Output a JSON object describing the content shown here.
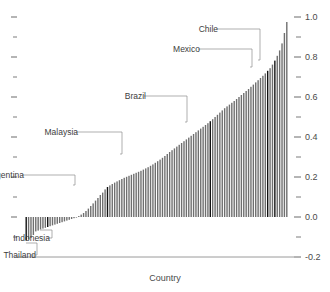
{
  "chart_data": {
    "type": "bar",
    "title": "",
    "xlabel": "Country",
    "ylabel": "",
    "ylim": [
      -0.2,
      1.0
    ],
    "grid": false,
    "legend": null,
    "right_axis_ticks": [
      "1.0",
      "0.8",
      "0.6",
      "0.4",
      "0.2",
      "0.0",
      "-0.2"
    ],
    "right_axis_tick_values": [
      1.0,
      0.8,
      0.6,
      0.4,
      0.2,
      0.0,
      -0.2
    ],
    "minor_tick_values": [
      0.9,
      0.7,
      0.5,
      0.3,
      0.1,
      -0.1
    ],
    "left_axis_tick_values": [
      1.0,
      0.9,
      0.8,
      0.7,
      0.6,
      0.5,
      0.4,
      0.3,
      0.2,
      0.1,
      0.0,
      -0.1
    ],
    "left_axis_labels": [],
    "categories": [
      "c1",
      "c2",
      "c3",
      "c4",
      "c5",
      "c6",
      "c7",
      "c8",
      "c9",
      "c10",
      "c11",
      "c12",
      "c13",
      "c14",
      "c15",
      "c16",
      "c17",
      "c18",
      "c19",
      "c20",
      "c21",
      "c22",
      "c23",
      "c24",
      "c25",
      "c26",
      "c27",
      "c28",
      "c29",
      "c30",
      "c31",
      "c32",
      "c33",
      "c34",
      "c35",
      "c36",
      "c37",
      "c38",
      "c39",
      "c40",
      "c41",
      "c42",
      "c43",
      "c44",
      "c45",
      "c46",
      "c47",
      "c48",
      "c49",
      "c50",
      "c51",
      "c52",
      "c53",
      "c54",
      "c55",
      "c56",
      "c57",
      "c58",
      "c59",
      "c60",
      "c61",
      "c62",
      "c63",
      "c64",
      "c65",
      "c66",
      "c67",
      "c68",
      "c69",
      "c70",
      "c71",
      "c72",
      "c73",
      "c74",
      "c75",
      "c76",
      "c77",
      "c78",
      "c79",
      "c80",
      "c81",
      "c82",
      "c83",
      "c84",
      "c85",
      "c86",
      "c87",
      "c88",
      "c89",
      "c90",
      "c91",
      "c92",
      "c93",
      "c94",
      "c95",
      "c96",
      "c97",
      "c98",
      "c99",
      "c100",
      "c101",
      "c102",
      "c103",
      "c104",
      "c105",
      "c106",
      "c107",
      "c108",
      "c109",
      "c110"
    ],
    "values": [
      -0.118,
      -0.112,
      -0.104,
      -0.09,
      -0.072,
      -0.068,
      -0.062,
      -0.058,
      -0.054,
      -0.05,
      -0.046,
      -0.042,
      -0.038,
      -0.034,
      -0.03,
      -0.026,
      -0.022,
      -0.018,
      -0.014,
      -0.01,
      -0.006,
      -0.003,
      0.005,
      0.012,
      0.02,
      0.03,
      0.042,
      0.055,
      0.068,
      0.082,
      0.095,
      0.11,
      0.122,
      0.138,
      0.15,
      0.158,
      0.165,
      0.172,
      0.178,
      0.184,
      0.19,
      0.196,
      0.201,
      0.206,
      0.211,
      0.216,
      0.221,
      0.226,
      0.231,
      0.237,
      0.243,
      0.249,
      0.256,
      0.263,
      0.271,
      0.279,
      0.287,
      0.296,
      0.305,
      0.315,
      0.325,
      0.334,
      0.343,
      0.352,
      0.361,
      0.37,
      0.379,
      0.388,
      0.397,
      0.406,
      0.415,
      0.424,
      0.433,
      0.442,
      0.451,
      0.46,
      0.469,
      0.479,
      0.489,
      0.5,
      0.511,
      0.522,
      0.533,
      0.544,
      0.553,
      0.562,
      0.571,
      0.58,
      0.59,
      0.6,
      0.61,
      0.62,
      0.63,
      0.64,
      0.651,
      0.662,
      0.673,
      0.684,
      0.695,
      0.706,
      0.718,
      0.731,
      0.744,
      0.762,
      0.782,
      0.806,
      0.833,
      0.868,
      0.92,
      0.975
    ],
    "highlighted_indices": [
      0,
      9,
      34,
      77,
      101,
      104
    ],
    "annotations": [
      {
        "name": "Thailand",
        "value": -0.118,
        "bar_index": 0,
        "label_x": 36,
        "label_y": 258,
        "leader": "M 30 255 L 37 255 L 37 243 L 26 243"
      },
      {
        "name": "Indonesia",
        "value": -0.05,
        "bar_index": 9,
        "label_x": 50,
        "label_y": 241,
        "leader": "M 47 238 L 52 238 L 52 230 L 40 230"
      },
      {
        "name": "Argentina",
        "value": 0.15,
        "bar_index": 34,
        "label_x": 24,
        "label_y": 178,
        "leader": "M 22 175 L 75 175 L 75 185 L 73 185"
      },
      {
        "name": "Malaysia",
        "value": 0.479,
        "bar_index": 77,
        "label_x": 78,
        "label_y": 135,
        "leader": "M 76 132 L 122 132 L 122 154 L 120 154"
      },
      {
        "name": "Brazil",
        "value": 0.718,
        "bar_index": 101,
        "label_x": 146,
        "label_y": 99,
        "leader": "M 144 96 L 187 96 L 187 122 L 185 122"
      },
      {
        "name": "Mexico",
        "value": 0.806,
        "bar_index": 104,
        "label_x": 200,
        "label_y": 52,
        "leader": "M 198 49 L 252 49 L 252 67 L 250 67"
      },
      {
        "name": "Chile",
        "value": 0.833,
        "bar_index": 105,
        "label_x": 218,
        "label_y": 32,
        "leader": "M 216 29 L 260 29 L 260 60 L 258 60"
      }
    ]
  },
  "colors": {
    "bar": "#6f6f6f",
    "bar_highlight": "#111111",
    "axis": "#5a5a5a",
    "text": "#3d3d3d",
    "leader": "#8d8d8d",
    "background": "#ffffff"
  },
  "axis": {
    "x_title": "Country"
  }
}
